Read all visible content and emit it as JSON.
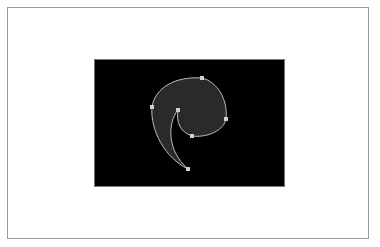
{
  "figure": {
    "colors": {
      "background": "#ffffff",
      "frame_border": "#9a9a9a",
      "artboard": "#000000",
      "shape_fill": "#2a2a2a",
      "path_stroke": "#bdbdbd",
      "anchor": "#cfcfcf"
    },
    "anchors": [
      {
        "x": 202,
        "y": 78
      },
      {
        "x": 152,
        "y": 107
      },
      {
        "x": 178,
        "y": 110
      },
      {
        "x": 226,
        "y": 119
      },
      {
        "x": 192,
        "y": 136
      },
      {
        "x": 188,
        "y": 169
      }
    ]
  }
}
